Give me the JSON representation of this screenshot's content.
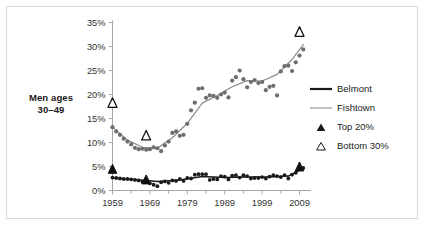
{
  "side_label": {
    "line1": "Men ages",
    "line2": "30–49"
  },
  "legend": {
    "items": [
      {
        "label": "Belmont",
        "key": "thick-dark-line",
        "color": "#1a1a1a"
      },
      {
        "label": "Fishtown",
        "key": "thin-gray-line",
        "color": "#8c8c8c"
      },
      {
        "label": "Top 20%",
        "key": "filled-triangle",
        "color": "#1a1a1a"
      },
      {
        "label": "Bottom 30%",
        "key": "open-triangle",
        "color": "#1a1a1a"
      }
    ]
  },
  "chart_data": {
    "type": "scatter",
    "title": "",
    "xlabel": "",
    "ylabel": "",
    "xlim": [
      1959,
      2011
    ],
    "ylim": [
      0,
      35
    ],
    "grid": false,
    "legend_position": "right",
    "y_ticks": [
      "0%",
      "5%",
      "10%",
      "15%",
      "20%",
      "25%",
      "30%",
      "35%"
    ],
    "y_tick_values": [
      0,
      5,
      10,
      15,
      20,
      25,
      30,
      35
    ],
    "x_ticks": [
      "1959",
      "1969",
      "1979",
      "1989",
      "1999",
      "2009"
    ],
    "x_tick_values": [
      1959,
      1969,
      1979,
      1989,
      1999,
      2009
    ],
    "x_minor_tick_values": [
      1964,
      1974,
      1984,
      1994,
      2004
    ],
    "series": [
      {
        "name": "Fishtown",
        "marker": "circle",
        "color": "#6e6e6e",
        "line_color": "#8c8c8c",
        "points": [
          [
            1959,
            13.2
          ],
          [
            1960,
            12.3
          ],
          [
            1961,
            11.6
          ],
          [
            1962,
            10.8
          ],
          [
            1963,
            10.2
          ],
          [
            1964,
            9.6
          ],
          [
            1965,
            8.9
          ],
          [
            1966,
            8.6
          ],
          [
            1967,
            8.7
          ],
          [
            1968,
            8.5
          ],
          [
            1969,
            8.6
          ],
          [
            1970,
            9.0
          ],
          [
            1971,
            8.8
          ],
          [
            1972,
            8.2
          ],
          [
            1973,
            9.4
          ],
          [
            1974,
            10.2
          ],
          [
            1975,
            12.0
          ],
          [
            1976,
            12.3
          ],
          [
            1977,
            11.4
          ],
          [
            1978,
            11.6
          ],
          [
            1979,
            13.9
          ],
          [
            1980,
            16.7
          ],
          [
            1981,
            18.3
          ],
          [
            1982,
            21.2
          ],
          [
            1983,
            21.3
          ],
          [
            1984,
            19.3
          ],
          [
            1985,
            19.8
          ],
          [
            1986,
            19.7
          ],
          [
            1987,
            19.3
          ],
          [
            1988,
            20.0
          ],
          [
            1989,
            20.4
          ],
          [
            1990,
            19.4
          ],
          [
            1991,
            22.9
          ],
          [
            1992,
            23.6
          ],
          [
            1993,
            25.0
          ],
          [
            1994,
            23.2
          ],
          [
            1995,
            21.5
          ],
          [
            1996,
            22.6
          ],
          [
            1997,
            23.0
          ],
          [
            1998,
            22.4
          ],
          [
            1999,
            22.6
          ],
          [
            2000,
            20.9
          ],
          [
            2001,
            21.6
          ],
          [
            2002,
            21.8
          ],
          [
            2003,
            19.8
          ],
          [
            2004,
            24.8
          ],
          [
            2005,
            25.9
          ],
          [
            2006,
            26.0
          ],
          [
            2007,
            24.9
          ],
          [
            2008,
            26.7
          ],
          [
            2009,
            28.1
          ],
          [
            2010,
            29.4
          ]
        ],
        "trend": [
          [
            1959,
            13.2
          ],
          [
            1963,
            10.5
          ],
          [
            1967,
            9.0
          ],
          [
            1971,
            8.8
          ],
          [
            1975,
            11.0
          ],
          [
            1979,
            14.0
          ],
          [
            1983,
            18.2
          ],
          [
            1987,
            19.8
          ],
          [
            1991,
            21.6
          ],
          [
            1995,
            22.9
          ],
          [
            1999,
            22.8
          ],
          [
            2003,
            24.2
          ],
          [
            2007,
            27.3
          ],
          [
            2010,
            30.4
          ]
        ]
      },
      {
        "name": "Belmont",
        "marker": "circle",
        "color": "#1a1a1a",
        "line_color": "#1a1a1a",
        "points": [
          [
            1959,
            2.7
          ],
          [
            1960,
            2.6
          ],
          [
            1961,
            2.5
          ],
          [
            1962,
            2.4
          ],
          [
            1963,
            2.4
          ],
          [
            1964,
            2.3
          ],
          [
            1965,
            2.2
          ],
          [
            1966,
            2.1
          ],
          [
            1967,
            1.8
          ],
          [
            1968,
            2.0
          ],
          [
            1969,
            1.5
          ],
          [
            1970,
            1.2
          ],
          [
            1971,
            0.9
          ],
          [
            1972,
            1.7
          ],
          [
            1973,
            1.9
          ],
          [
            1974,
            1.6
          ],
          [
            1975,
            2.1
          ],
          [
            1976,
            2.0
          ],
          [
            1977,
            2.4
          ],
          [
            1978,
            2.0
          ],
          [
            1979,
            2.6
          ],
          [
            1980,
            2.5
          ],
          [
            1981,
            3.3
          ],
          [
            1982,
            3.4
          ],
          [
            1983,
            3.4
          ],
          [
            1984,
            3.4
          ],
          [
            1985,
            2.2
          ],
          [
            1986,
            2.4
          ],
          [
            1987,
            2.3
          ],
          [
            1988,
            3.0
          ],
          [
            1989,
            2.9
          ],
          [
            1990,
            2.3
          ],
          [
            1991,
            3.1
          ],
          [
            1992,
            3.2
          ],
          [
            1993,
            2.7
          ],
          [
            1994,
            3.2
          ],
          [
            1995,
            3.0
          ],
          [
            1996,
            2.5
          ],
          [
            1997,
            2.6
          ],
          [
            1998,
            2.6
          ],
          [
            1999,
            2.8
          ],
          [
            2000,
            2.5
          ],
          [
            2001,
            2.9
          ],
          [
            2002,
            3.2
          ],
          [
            2003,
            3.0
          ],
          [
            2004,
            2.8
          ],
          [
            2005,
            3.2
          ],
          [
            2006,
            2.5
          ],
          [
            2007,
            3.3
          ],
          [
            2008,
            3.7
          ],
          [
            2009,
            4.5
          ],
          [
            2010,
            4.7
          ]
        ],
        "trend": [
          [
            1959,
            2.6
          ],
          [
            1965,
            2.3
          ],
          [
            1971,
            1.9
          ],
          [
            1977,
            2.2
          ],
          [
            1983,
            2.9
          ],
          [
            1989,
            2.7
          ],
          [
            1995,
            2.8
          ],
          [
            2001,
            2.8
          ],
          [
            2006,
            3.0
          ],
          [
            2010,
            4.6
          ]
        ]
      }
    ],
    "annotations": [
      {
        "name": "Bottom 30%",
        "marker": "open-triangle",
        "x": 1959,
        "y": 18.2
      },
      {
        "name": "Bottom 30%",
        "marker": "open-triangle",
        "x": 1968,
        "y": 11.4
      },
      {
        "name": "Bottom 30%",
        "marker": "open-triangle",
        "x": 2009,
        "y": 33.0
      },
      {
        "name": "Top 20%",
        "marker": "filled-triangle",
        "x": 1959,
        "y": 4.4
      },
      {
        "name": "Top 20%",
        "marker": "filled-triangle",
        "x": 1968,
        "y": 2.2
      },
      {
        "name": "Top 20%",
        "marker": "filled-triangle",
        "x": 2009,
        "y": 4.9
      }
    ]
  }
}
